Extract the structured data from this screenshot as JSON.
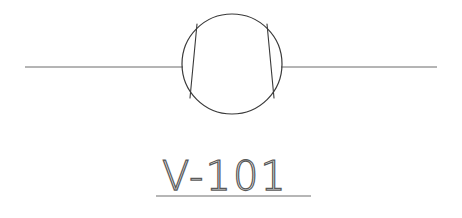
{
  "diagram": {
    "type": "p-and-id-symbol",
    "background_color": "#ffffff",
    "line_color": "#6b6b6b",
    "symbol_color": "#3a3a3a",
    "text_color": "#5a5a5a",
    "equipment": {
      "symbol_name": "vessel-circle-symbol",
      "shape": "circle",
      "center_x": 232,
      "center_y": 64,
      "radius": 50,
      "inner_chords": [
        {
          "name": "left-chord",
          "x1": 197,
          "y1": 24,
          "x2": 190,
          "y2": 98
        },
        {
          "name": "right-chord",
          "x1": 267,
          "y1": 24,
          "x2": 274,
          "y2": 98
        }
      ]
    },
    "pipes": [
      {
        "name": "inlet-pipe-line",
        "x1": 25,
        "y1": 67,
        "x2": 183,
        "y2": 67
      },
      {
        "name": "outlet-pipe-line",
        "x1": 281,
        "y1": 67,
        "x2": 437,
        "y2": 67
      }
    ],
    "tag": {
      "label": "V-101",
      "x": 162,
      "baseline_y": 190,
      "underline": {
        "x1": 156,
        "y1": 196,
        "x2": 311,
        "y2": 196
      }
    }
  }
}
